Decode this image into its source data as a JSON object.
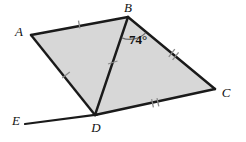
{
  "figure": {
    "background_color": "#ffffff",
    "fill_color": "#d7d7d7",
    "stroke_color": "#1a1a1a",
    "tick_color": "#8a8a8a",
    "arc_color": "#6f6f6f"
  },
  "vertices": {
    "A": {
      "label": "A",
      "x": 31,
      "y": 35,
      "label_x": 19,
      "label_y": 36
    },
    "B": {
      "label": "B",
      "x": 128,
      "y": 17,
      "label_x": 124,
      "label_y": 12
    },
    "C": {
      "label": "C",
      "x": 215,
      "y": 89,
      "label_x": 222,
      "label_y": 97
    },
    "D": {
      "label": "D",
      "x": 95,
      "y": 115,
      "label_x": 91,
      "label_y": 132
    },
    "E": {
      "label": "E",
      "x": 25,
      "y": 124,
      "label_x": 13,
      "label_y": 125
    }
  },
  "angle": {
    "at_vertex": "B",
    "value": "74",
    "unit": "°",
    "text": "74°",
    "label_x": 129,
    "label_y": 43
  },
  "segments": [
    {
      "name": "AB",
      "from": "A",
      "to": "B",
      "ticks": 1
    },
    {
      "name": "BC",
      "from": "B",
      "to": "C",
      "ticks": 2
    },
    {
      "name": "CD",
      "from": "C",
      "to": "D",
      "ticks": 2
    },
    {
      "name": "DA",
      "from": "D",
      "to": "A",
      "ticks": 1
    },
    {
      "name": "BD",
      "from": "B",
      "to": "D",
      "ticks": 1
    },
    {
      "name": "ED",
      "from": "E",
      "to": "D",
      "ticks": 0
    }
  ]
}
